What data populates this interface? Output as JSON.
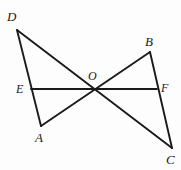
{
  "figure": {
    "background_color": "#fdfdfd",
    "stroke_color": "#1a1a1a",
    "canvas": {
      "width": 181,
      "height": 170
    }
  },
  "labels": {
    "D": "D",
    "B": "B",
    "E": "E",
    "O": "O",
    "F": "F",
    "A": "A",
    "C": "C"
  },
  "points": {
    "D": {
      "x": 17,
      "y": 30,
      "label_x": 7,
      "label_y": 10
    },
    "B": {
      "x": 150,
      "y": 52,
      "label_x": 145,
      "label_y": 35
    },
    "E": {
      "x": 31,
      "y": 89,
      "label_x": 16,
      "label_y": 83
    },
    "O": {
      "x": 95,
      "y": 90,
      "label_x": 88,
      "label_y": 70
    },
    "F": {
      "x": 157,
      "y": 89,
      "label_x": 161,
      "label_y": 82
    },
    "A": {
      "x": 41,
      "y": 126,
      "label_x": 35,
      "label_y": 131
    },
    "C": {
      "x": 172,
      "y": 148,
      "label_x": 166,
      "label_y": 153
    }
  },
  "segments": [
    {
      "name": "segment-DA",
      "from": "D",
      "to": "A",
      "d": "M 17 30 L 41 126"
    },
    {
      "name": "segment-DC",
      "from": "D",
      "to": "C",
      "d": "M 17 30 L 172 148"
    },
    {
      "name": "segment-AB",
      "from": "A",
      "to": "B",
      "d": "M 41 126 L 150 52"
    },
    {
      "name": "segment-BC",
      "from": "B",
      "to": "C",
      "d": "M 150 52 L 172 148"
    },
    {
      "name": "segment-EF",
      "from": "E",
      "to": "F",
      "d": "M 31 89 L 157 89"
    }
  ],
  "stroke_width": 1.9
}
